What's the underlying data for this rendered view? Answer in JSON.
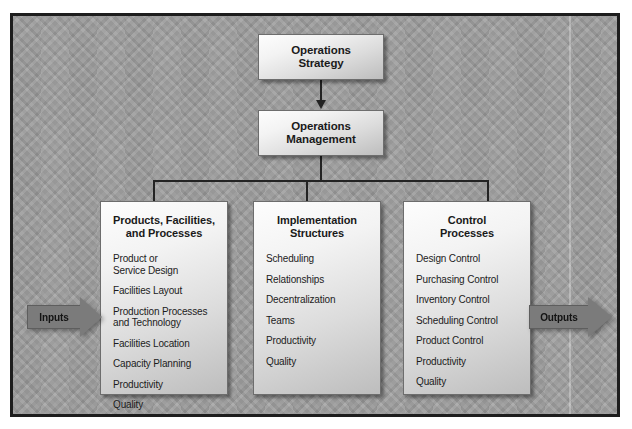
{
  "diagram": {
    "top_nodes": [
      {
        "id": "operations-strategy",
        "label": "Operations\nStrategy"
      },
      {
        "id": "operations-management",
        "label": "Operations\nManagement"
      }
    ],
    "top_node_labels": {
      "strategy_line1": "Operations",
      "strategy_line2": "Strategy",
      "management_line1": "Operations",
      "management_line2": "Management"
    },
    "columns": [
      {
        "id": "products-facilities-processes",
        "title_line1": "Products, Facilities,",
        "title_line2": "and Processes",
        "items": [
          "Product or\nService Design",
          "Facilities Layout",
          "Production Processes\nand Technology",
          "Facilities Location",
          "Capacity Planning",
          "Productivity",
          "Quality"
        ],
        "items_flat": [
          {
            "l1": "Product or",
            "l2": "Service Design"
          },
          {
            "l1": "Facilities Layout",
            "l2": ""
          },
          {
            "l1": "Production Processes",
            "l2": "and Technology"
          },
          {
            "l1": "Facilities Location",
            "l2": ""
          },
          {
            "l1": "Capacity Planning",
            "l2": ""
          },
          {
            "l1": "Productivity",
            "l2": ""
          },
          {
            "l1": "Quality",
            "l2": ""
          }
        ]
      },
      {
        "id": "implementation-structures",
        "title_line1": "Implementation",
        "title_line2": "Structures",
        "items": [
          "Scheduling",
          "Relationships",
          "Decentralization",
          "Teams",
          "Productivity",
          "Quality"
        ],
        "items_flat": [
          {
            "l1": "Scheduling",
            "l2": ""
          },
          {
            "l1": "Relationships",
            "l2": ""
          },
          {
            "l1": "Decentralization",
            "l2": ""
          },
          {
            "l1": "Teams",
            "l2": ""
          },
          {
            "l1": "Productivity",
            "l2": ""
          },
          {
            "l1": "Quality",
            "l2": ""
          }
        ]
      },
      {
        "id": "control-processes",
        "title_line1": "Control",
        "title_line2": "Processes",
        "items": [
          "Design Control",
          "Purchasing Control",
          "Inventory Control",
          "Scheduling Control",
          "Product Control",
          "Productivity",
          "Quality"
        ],
        "items_flat": [
          {
            "l1": "Design Control",
            "l2": ""
          },
          {
            "l1": "Purchasing Control",
            "l2": ""
          },
          {
            "l1": "Inventory Control",
            "l2": ""
          },
          {
            "l1": "Scheduling Control",
            "l2": ""
          },
          {
            "l1": "Product Control",
            "l2": ""
          },
          {
            "l1": "Productivity",
            "l2": ""
          },
          {
            "l1": "Quality",
            "l2": ""
          }
        ]
      }
    ],
    "io": {
      "input_label": "Inputs",
      "output_label": "Outputs"
    },
    "colors": {
      "background": "#9a9a9a",
      "frame_border": "#1d1d1d",
      "node_fill_light": "#fdfdfd",
      "node_fill_dark": "#bdbdbd",
      "node_border": "#6d6d6d",
      "connector": "#232323",
      "io_arrow": "#7b7b7b",
      "text": "#1a1a1a"
    }
  }
}
